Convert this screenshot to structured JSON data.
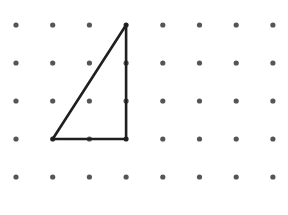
{
  "diagram": {
    "type": "dot-grid-with-triangle",
    "grid": {
      "columns": 8,
      "rows": 5,
      "dot_color": "#555555"
    },
    "triangle": {
      "vertices_grid": [
        [
          3,
          0
        ],
        [
          1,
          3
        ],
        [
          3,
          3
        ]
      ],
      "line_color": "#1f1f1f",
      "description": "Right triangle: vertical leg 3 units, horizontal leg 2 units"
    }
  }
}
